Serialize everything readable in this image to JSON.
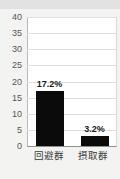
{
  "chart_data": {
    "type": "bar",
    "title": "",
    "subtitle": "",
    "xlabel": "",
    "ylabel": "",
    "categories": [
      "回避群",
      "摂取群"
    ],
    "values": [
      17.2,
      3.2
    ],
    "data_labels": [
      "17.2%",
      "3.2%"
    ],
    "ylim": [
      0,
      40
    ],
    "yticks": [
      0,
      5,
      10,
      15,
      20,
      25,
      30,
      35,
      40
    ],
    "ytick_labels": [
      "0",
      "5",
      "10",
      "15",
      "20",
      "25",
      "30",
      "35",
      "40"
    ],
    "grid": true,
    "grid_axis": "y",
    "legend": false,
    "legend_position": "none",
    "bar_color": "#0b0b0b",
    "plot_background": "#ffffff",
    "figure_background": "#f3f3f1",
    "gridline_color": "#dedede",
    "axis_color": "#8f8f8f",
    "tick_label_color": "#555555",
    "data_label_color": "#1a1a1a",
    "category_label_color": "#3a3a3a"
  }
}
